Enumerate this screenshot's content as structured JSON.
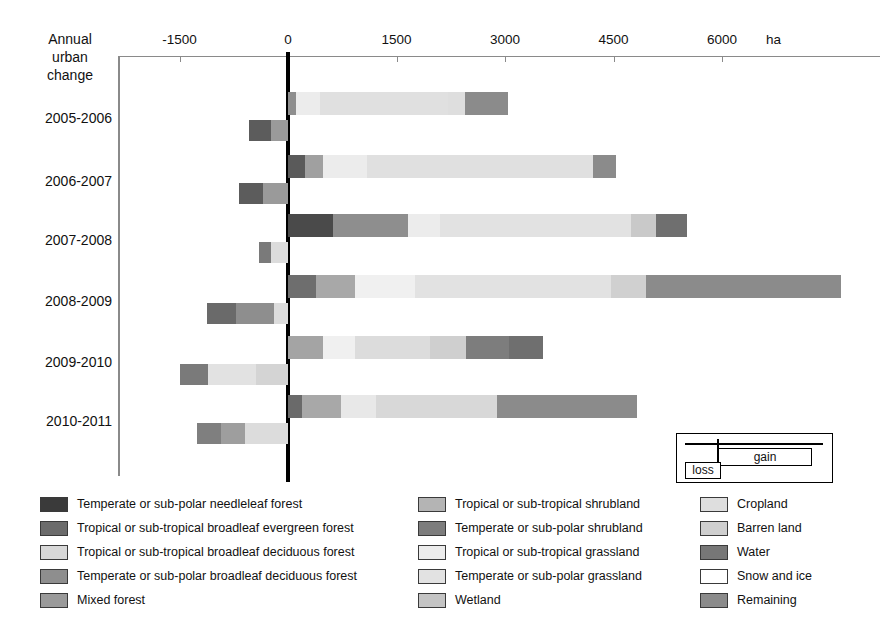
{
  "corner_title": "Annual\nurban\nchange",
  "axis": {
    "unit": "ha",
    "ticks": [
      -1500,
      0,
      1500,
      3000,
      4500,
      6000
    ],
    "tick_labels": [
      "-1500",
      "0",
      "1500",
      "3000",
      "4500",
      "6000"
    ],
    "min": -1800,
    "max": 8200
  },
  "inset": {
    "gain_label": "gain",
    "loss_label": "loss"
  },
  "chart_data": {
    "type": "bar",
    "orientation": "horizontal",
    "stacked": true,
    "xlabel": "ha",
    "ylabel": "",
    "xlim": [
      -1800,
      8200
    ],
    "grid": false,
    "legend_position": "bottom",
    "categories": [
      "2005-2006",
      "2006-2007",
      "2007-2008",
      "2008-2009",
      "2009-2010",
      "2010-2011"
    ],
    "classes": [
      {
        "name": "Temperate or sub-polar needleleaf forest",
        "color": "#3a3a3a"
      },
      {
        "name": "Tropical or sub-tropical broadleaf evergreen forest",
        "color": "#6b6b6b"
      },
      {
        "name": "Tropical or sub-tropical broadleaf deciduous forest",
        "color": "#d8d8d8"
      },
      {
        "name": "Temperate or sub-polar broadleaf deciduous forest",
        "color": "#8e8e8e"
      },
      {
        "name": "Mixed forest",
        "color": "#9a9a9a"
      },
      {
        "name": "Tropical or sub-tropical shrubland",
        "color": "#b4b4b4"
      },
      {
        "name": "Temperate or sub-polar shrubland",
        "color": "#7d7d7d"
      },
      {
        "name": "Tropical or sub-tropical grassland",
        "color": "#ececec"
      },
      {
        "name": "Temperate or sub-polar grassland",
        "color": "#e2e2e2"
      },
      {
        "name": "Wetland",
        "color": "#c4c4c4"
      },
      {
        "name": "Cropland",
        "color": "#dedede"
      },
      {
        "name": "Barren land",
        "color": "#cfcfcf"
      },
      {
        "name": "Water",
        "color": "#777777"
      },
      {
        "name": "Snow and ice",
        "color": "#ffffff"
      },
      {
        "name": "Remaining",
        "color": "#8b8b8b"
      }
    ],
    "series": [
      {
        "category": "2005-2006",
        "gain_total": 3040,
        "loss_total": -540,
        "gain_segments": [
          {
            "class": "Temperate or sub-polar broadleaf deciduous forest",
            "value": 110,
            "color": "#8e8e8e"
          },
          {
            "class": "Tropical or sub-tropical grassland",
            "value": 330,
            "color": "#ececec"
          },
          {
            "class": "Temperate or sub-polar grassland",
            "value": 1770,
            "color": "#e0e0e0"
          },
          {
            "class": "Cropland",
            "value": 240,
            "color": "#dedede"
          },
          {
            "class": "Remaining",
            "value": 590,
            "color": "#8b8b8b"
          }
        ],
        "loss_segments": [
          {
            "class": "Temperate or sub-polar needleleaf forest",
            "value": -310,
            "color": "#5c5c5c"
          },
          {
            "class": "Remaining",
            "value": -230,
            "color": "#9a9a9a"
          }
        ]
      },
      {
        "category": "2006-2007",
        "gain_total": 4540,
        "loss_total": -680,
        "gain_segments": [
          {
            "class": "Temperate or sub-polar needleleaf forest",
            "value": 230,
            "color": "#5a5a5a"
          },
          {
            "class": "Temperate or sub-polar broadleaf deciduous forest",
            "value": 250,
            "color": "#a0a0a0"
          },
          {
            "class": "Tropical or sub-tropical grassland",
            "value": 610,
            "color": "#ececec"
          },
          {
            "class": "Temperate or sub-polar grassland",
            "value": 3130,
            "color": "#e0e0e0"
          },
          {
            "class": "Remaining",
            "value": 320,
            "color": "#8b8b8b"
          }
        ],
        "loss_segments": [
          {
            "class": "Temperate or sub-polar needleleaf forest",
            "value": -330,
            "color": "#5c5c5c"
          },
          {
            "class": "Remaining",
            "value": -350,
            "color": "#9a9a9a"
          }
        ]
      },
      {
        "category": "2007-2008",
        "gain_total": 5510,
        "loss_total": -400,
        "gain_segments": [
          {
            "class": "Temperate or sub-polar needleleaf forest",
            "value": 620,
            "color": "#4a4a4a"
          },
          {
            "class": "Temperate or sub-polar broadleaf deciduous forest",
            "value": 1040,
            "color": "#8e8e8e"
          },
          {
            "class": "Tropical or sub-tropical grassland",
            "value": 440,
            "color": "#ececec"
          },
          {
            "class": "Temperate or sub-polar grassland",
            "value": 2640,
            "color": "#e2e2e2"
          },
          {
            "class": "Cropland",
            "value": 350,
            "color": "#c9c9c9"
          },
          {
            "class": "Remaining",
            "value": 420,
            "color": "#6f6f6f"
          }
        ],
        "loss_segments": [
          {
            "class": "Temperate or sub-polar needleleaf forest",
            "value": -160,
            "color": "#7a7a7a"
          },
          {
            "class": "Tropical or sub-tropical grassland",
            "value": -240,
            "color": "#dcdcdc"
          }
        ]
      },
      {
        "category": "2008-2009",
        "gain_total": 7650,
        "loss_total": -1120,
        "gain_segments": [
          {
            "class": "Temperate or sub-polar needleleaf forest",
            "value": 390,
            "color": "#6e6e6e"
          },
          {
            "class": "Temperate or sub-polar broadleaf deciduous forest",
            "value": 540,
            "color": "#a8a8a8"
          },
          {
            "class": "Tropical or sub-tropical grassland",
            "value": 830,
            "color": "#f0f0f0"
          },
          {
            "class": "Temperate or sub-polar grassland",
            "value": 2700,
            "color": "#e2e2e2"
          },
          {
            "class": "Cropland",
            "value": 490,
            "color": "#d0d0d0"
          },
          {
            "class": "Remaining",
            "value": 2700,
            "color": "#8b8b8b"
          }
        ],
        "loss_segments": [
          {
            "class": "Temperate or sub-polar needleleaf forest",
            "value": -400,
            "color": "#6a6a6a"
          },
          {
            "class": "Temperate or sub-polar broadleaf deciduous forest",
            "value": -530,
            "color": "#8e8e8e"
          },
          {
            "class": "Tropical or sub-tropical grassland",
            "value": -190,
            "color": "#dcdcdc"
          }
        ]
      },
      {
        "category": "2009-2010",
        "gain_total": 3520,
        "loss_total": -1500,
        "gain_segments": [
          {
            "class": "Temperate or sub-polar broadleaf deciduous forest",
            "value": 490,
            "color": "#a4a4a4"
          },
          {
            "class": "Tropical or sub-tropical grassland",
            "value": 440,
            "color": "#f0f0f0"
          },
          {
            "class": "Temperate or sub-polar grassland",
            "value": 1040,
            "color": "#dcdcdc"
          },
          {
            "class": "Cropland",
            "value": 490,
            "color": "#cfcfcf"
          },
          {
            "class": "Water",
            "value": 600,
            "color": "#7d7d7d"
          },
          {
            "class": "Remaining",
            "value": 460,
            "color": "#6f6f6f"
          }
        ],
        "loss_segments": [
          {
            "class": "Temperate or sub-polar needleleaf forest",
            "value": -400,
            "color": "#7a7a7a"
          },
          {
            "class": "Tropical or sub-tropical grassland",
            "value": -660,
            "color": "#e2e2e2"
          },
          {
            "class": "Temperate or sub-polar grassland",
            "value": -440,
            "color": "#d4d4d4"
          }
        ]
      },
      {
        "category": "2010-2011",
        "gain_total": 4820,
        "loss_total": -1260,
        "gain_segments": [
          {
            "class": "Temperate or sub-polar needleleaf forest",
            "value": 200,
            "color": "#6a6a6a"
          },
          {
            "class": "Temperate or sub-polar broadleaf deciduous forest",
            "value": 530,
            "color": "#a8a8a8"
          },
          {
            "class": "Tropical or sub-tropical grassland",
            "value": 480,
            "color": "#e8e8e8"
          },
          {
            "class": "Temperate or sub-polar grassland",
            "value": 1680,
            "color": "#d8d8d8"
          },
          {
            "class": "Remaining",
            "value": 1930,
            "color": "#8b8b8b"
          }
        ],
        "loss_segments": [
          {
            "class": "Temperate or sub-polar needleleaf forest",
            "value": -330,
            "color": "#7f7f7f"
          },
          {
            "class": "Temperate or sub-polar broadleaf deciduous forest",
            "value": -330,
            "color": "#9e9e9e"
          },
          {
            "class": "Tropical or sub-tropical grassland",
            "value": -600,
            "color": "#dcdcdc"
          }
        ]
      }
    ]
  },
  "legend": {
    "columns": [
      {
        "items": [
          {
            "label": "Temperate or sub-polar needleleaf forest",
            "color": "#3a3a3a"
          },
          {
            "label": "Tropical or sub-tropical broadleaf evergreen forest",
            "color": "#6b6b6b"
          },
          {
            "label": "Tropical or sub-tropical broadleaf deciduous forest",
            "color": "#d8d8d8"
          },
          {
            "label": "Temperate or sub-polar broadleaf deciduous forest",
            "color": "#8e8e8e"
          },
          {
            "label": "Mixed forest",
            "color": "#9a9a9a"
          }
        ]
      },
      {
        "items": [
          {
            "label": "Tropical or sub-tropical shrubland",
            "color": "#b4b4b4"
          },
          {
            "label": "Temperate or sub-polar shrubland",
            "color": "#7d7d7d"
          },
          {
            "label": "Tropical or sub-tropical grassland",
            "color": "#ececec"
          },
          {
            "label": "Temperate or sub-polar grassland",
            "color": "#e2e2e2"
          },
          {
            "label": "Wetland",
            "color": "#c4c4c4"
          }
        ]
      },
      {
        "items": [
          {
            "label": "Cropland",
            "color": "#dedede"
          },
          {
            "label": "Barren land",
            "color": "#cfcfcf"
          },
          {
            "label": "Water",
            "color": "#777777"
          },
          {
            "label": "Snow and ice",
            "color": "#ffffff"
          },
          {
            "label": "Remaining",
            "color": "#8b8b8b"
          }
        ]
      }
    ]
  }
}
